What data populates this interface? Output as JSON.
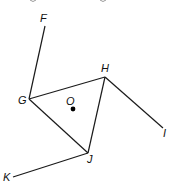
{
  "diagram": {
    "points": {
      "F": {
        "label": "F",
        "x": 45,
        "y": 26,
        "lx": 40,
        "ly": 22
      },
      "G": {
        "label": "G",
        "x": 29,
        "y": 99,
        "lx": 18,
        "ly": 104
      },
      "H": {
        "label": "H",
        "x": 105,
        "y": 77,
        "lx": 101,
        "ly": 72
      },
      "I": {
        "label": "I",
        "x": 163,
        "y": 128,
        "lx": 163,
        "ly": 137
      },
      "J": {
        "label": "J",
        "x": 88,
        "y": 153,
        "lx": 87,
        "ly": 163
      },
      "K": {
        "label": "K",
        "x": 13,
        "y": 177,
        "lx": 3,
        "ly": 181
      },
      "O": {
        "label": "O",
        "x": 73,
        "y": 109,
        "lx": 66,
        "ly": 105
      }
    },
    "segments": [
      {
        "name": "segment-GF",
        "from": "G",
        "to": "F"
      },
      {
        "name": "segment-GH",
        "from": "G",
        "to": "H"
      },
      {
        "name": "segment-GJ",
        "from": "G",
        "to": "J"
      },
      {
        "name": "segment-HJ",
        "from": "H",
        "to": "J"
      },
      {
        "name": "segment-HI",
        "from": "H",
        "to": "I"
      },
      {
        "name": "segment-JK",
        "from": "J",
        "to": "K"
      }
    ],
    "center_point": "O"
  }
}
